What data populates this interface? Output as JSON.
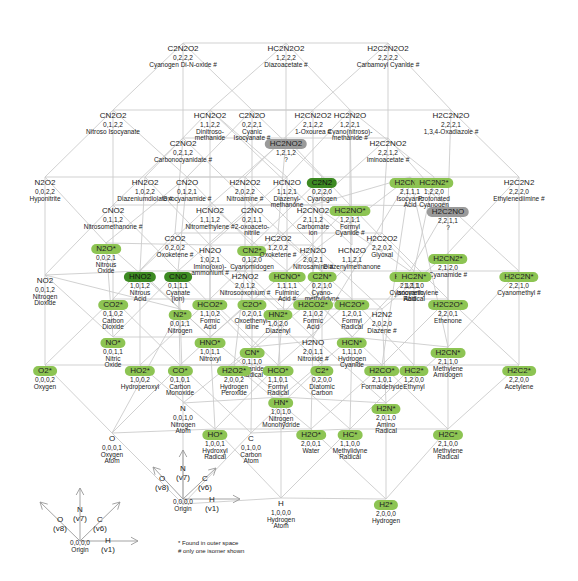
{
  "diagram": {
    "nodes": [
      {
        "id": "C2N2O2",
        "formula": "C2N2O2",
        "coords": "0,2,2,2",
        "name": "Cyanogen Di-N-oxide #",
        "x": 183,
        "y": 38,
        "hl": ""
      },
      {
        "id": "HC2N2O2",
        "formula": "HC2N2O2",
        "coords": "1,2,2,2",
        "name": "Diazoacetate #",
        "x": 286,
        "y": 38,
        "hl": ""
      },
      {
        "id": "H2C2N2O2",
        "formula": "H2C2N2O2",
        "coords": "2,2,2,2",
        "name": "Carbamoyl Cyanide #",
        "x": 388,
        "y": 38,
        "hl": ""
      },
      {
        "id": "CN2O2",
        "formula": "CN2O2",
        "coords": "0,1,2,2",
        "name": "Nitroso Isocyanate",
        "x": 113,
        "y": 105,
        "hl": ""
      },
      {
        "id": "HCN2O2",
        "formula": "HCN2O2",
        "coords": "1,1,2,2",
        "name": "Dinitroso-|methanide",
        "x": 210,
        "y": 105,
        "hl": ""
      },
      {
        "id": "C2N2O",
        "formula": "C2N2O",
        "coords": "0,2,2,1",
        "name": "Cyanic|Isocyanate #",
        "x": 252,
        "y": 105,
        "hl": ""
      },
      {
        "id": "H2CN2O2",
        "formula": "H2CN2O2",
        "coords": "2,1,2,2",
        "name": "1-Oxourea #",
        "x": 313,
        "y": 105,
        "hl": ""
      },
      {
        "id": "HC2N2O",
        "formula": "HC2N2O",
        "coords": "1,2,2,1",
        "name": "Cyano(nitroso)-|methanide #",
        "x": 350,
        "y": 105,
        "hl": ""
      },
      {
        "id": "H2C2N2O",
        "formula": "H2C2N2O",
        "coords": "2,2,2,1",
        "name": "1,3,4-Oxadiazole #",
        "x": 451,
        "y": 105,
        "hl": ""
      },
      {
        "id": "C2NO2",
        "formula": "C2NO2",
        "coords": "0,2,1,2",
        "name": "Carbonocyanidate #",
        "x": 183,
        "y": 133,
        "hl": ""
      },
      {
        "id": "HC2NO2",
        "formula": "HC2NO2",
        "coords": "1,2,1,2",
        "name": "?",
        "x": 286,
        "y": 133,
        "hl": "gray"
      },
      {
        "id": "H2C2NO2",
        "formula": "H2C2NO2",
        "coords": "2,2,1,2",
        "name": "Iminoacetate #",
        "x": 388,
        "y": 133,
        "hl": ""
      },
      {
        "id": "N2O2",
        "formula": "N2O2",
        "coords": "0,0,2,2",
        "name": "Hyponitrite",
        "x": 45,
        "y": 172,
        "hl": ""
      },
      {
        "id": "HN2O2",
        "formula": "HN2O2",
        "coords": "1,0,2,2",
        "name": "Diazeniumdiolate #",
        "x": 145,
        "y": 172,
        "hl": ""
      },
      {
        "id": "CN2O",
        "formula": "CN2O",
        "coords": "0,1,2,1",
        "name": "Oxocyanamide #",
        "x": 187,
        "y": 172,
        "hl": ""
      },
      {
        "id": "H2N2O2",
        "formula": "H2N2O2",
        "coords": "2,0,2,2",
        "name": "Nitroamine #",
        "x": 245,
        "y": 172,
        "hl": ""
      },
      {
        "id": "HCN2O",
        "formula": "HCN2O",
        "coords": "1,1,2,1",
        "name": "Diazenyl-|methanone",
        "x": 287,
        "y": 172,
        "hl": ""
      },
      {
        "id": "C2N2",
        "formula": "C2N2",
        "coords": "0,2,2,0",
        "name": "Cyanogen",
        "x": 322,
        "y": 172,
        "hl": "dark"
      },
      {
        "id": "H2CNO_top",
        "formula": "H2CNO*",
        "coords": "2,1,1,1",
        "name": "Isocyanic|Acid",
        "x": 410,
        "y": 172,
        "hl": "light"
      },
      {
        "id": "HC2N2",
        "formula": "HC2N2*",
        "coords": "1,2,2,0",
        "name": "Protonated|Cyanogen",
        "x": 434,
        "y": 172,
        "hl": "light"
      },
      {
        "id": "H2C2N2",
        "formula": "H2C2N2",
        "coords": "2,2,2,0",
        "name": "Ethylenediimine #",
        "x": 519,
        "y": 172,
        "hl": ""
      },
      {
        "id": "H2C2NO",
        "formula": "H2C2NO",
        "coords": "2,2,1,1",
        "name": "?",
        "x": 448,
        "y": 201,
        "hl": "gray"
      },
      {
        "id": "CNO2",
        "formula": "CNO2",
        "coords": "0,1,1,2",
        "name": "Nitrosomethanone #",
        "x": 113,
        "y": 200,
        "hl": ""
      },
      {
        "id": "HCNO2",
        "formula": "HCNO2",
        "coords": "1,1,1,2",
        "name": "Nitromethylene #",
        "x": 210,
        "y": 200,
        "hl": ""
      },
      {
        "id": "C2NO",
        "formula": "C2NO",
        "coords": "0,2,1,1",
        "name": "2-oxoaceto-|nitrile",
        "x": 252,
        "y": 200,
        "hl": ""
      },
      {
        "id": "H2CNO2",
        "formula": "H2CNO2",
        "coords": "2,1,1,2",
        "name": "Carbomate|ion",
        "x": 313,
        "y": 200,
        "hl": ""
      },
      {
        "id": "HC2NO",
        "formula": "HC2NO*",
        "coords": "1,2,1,1",
        "name": "Formyl|Cyanide #",
        "x": 350,
        "y": 200,
        "hl": "light"
      },
      {
        "id": "N2O",
        "formula": "N2O*",
        "coords": "0,0,2,1",
        "name": "Nitrous|Oxide",
        "x": 106,
        "y": 238,
        "hl": "light"
      },
      {
        "id": "C2O2",
        "formula": "C2O2",
        "coords": "0,2,0,2",
        "name": "Oxoketene #",
        "x": 175,
        "y": 228,
        "hl": ""
      },
      {
        "id": "HN2O",
        "formula": "HN2O",
        "coords": "1,0,2,1",
        "name": "Imino(oxo)-|ammonium #",
        "x": 210,
        "y": 240,
        "hl": ""
      },
      {
        "id": "CN2",
        "formula": "CN2*",
        "coords": "0,1,2,0",
        "name": "Cyanomidogen",
        "x": 252,
        "y": 240,
        "hl": "light"
      },
      {
        "id": "HC2O2",
        "formula": "HC2O2",
        "coords": "1,2,0,2",
        "name": "Oxoketene #",
        "x": 278,
        "y": 228,
        "hl": ""
      },
      {
        "id": "H2N2O",
        "formula": "H2N2O",
        "coords": "2,0,2,1",
        "name": "Nitrosamine #",
        "x": 313,
        "y": 240,
        "hl": ""
      },
      {
        "id": "HCN2O_b",
        "formula": "HCN2O",
        "coords": "1,1,2,1",
        "name": "Diazenylmethanone",
        "x": 352,
        "y": 240,
        "hl": ""
      },
      {
        "id": "H2C2O2",
        "formula": "H2C2O2",
        "coords": "2,2,0,2",
        "name": "Glyoxal",
        "x": 382,
        "y": 228,
        "hl": ""
      },
      {
        "id": "H2CN2",
        "formula": "H2CN2*",
        "coords": "2,1,2,0",
        "name": "Cyanamide #",
        "x": 448,
        "y": 248,
        "hl": "light"
      },
      {
        "id": "NO2",
        "formula": "NO2",
        "coords": "0,0,1,2",
        "name": "Nitrogen|Dioxide",
        "x": 45,
        "y": 270,
        "hl": ""
      },
      {
        "id": "HNO2",
        "formula": "HNO2",
        "coords": "1,0,1,2",
        "name": "Nitrous|Acid",
        "x": 140,
        "y": 266,
        "hl": "dark"
      },
      {
        "id": "CNO",
        "formula": "CNO",
        "coords": "0,1,1,1",
        "name": "Cyanate|(ion)",
        "x": 178,
        "y": 266,
        "hl": "dark"
      },
      {
        "id": "H2NO2",
        "formula": "H2NO2",
        "coords": "2,0,1,2",
        "name": "Nitrosooxonium #",
        "x": 245,
        "y": 266,
        "hl": ""
      },
      {
        "id": "HCNO",
        "formula": "HCNO*",
        "coords": "1,1,1,1",
        "name": "Fulminic|Acid #",
        "x": 287,
        "y": 266,
        "hl": "light"
      },
      {
        "id": "C2N",
        "formula": "C2N*",
        "coords": "0,2,1,0",
        "name": "Cyano-|methylidyne",
        "x": 322,
        "y": 266,
        "hl": "light"
      },
      {
        "id": "H2CNO",
        "formula": "H2CNO*",
        "coords": "2,1,1,1",
        "name": "Isocyanic|Acid",
        "x": 410,
        "y": 266,
        "hl": "light"
      },
      {
        "id": "HC2N",
        "formula": "HC2N*",
        "coords": "1,2,1,0",
        "name": "Cyanomethylene|Radical",
        "x": 414,
        "y": 266,
        "hl": "light"
      },
      {
        "id": "H2C2N",
        "formula": "H2C2N*",
        "coords": "2,2,1,0",
        "name": "Cyanomethyl #",
        "x": 519,
        "y": 266,
        "hl": "light"
      },
      {
        "id": "CO2",
        "formula": "CO2*",
        "coords": "0,1,0,2",
        "name": "Carbon|Dioxide",
        "x": 113,
        "y": 294,
        "hl": "light"
      },
      {
        "id": "N2",
        "formula": "N2*",
        "coords": "0,0,1,1",
        "name": "Nitrogen",
        "x": 180,
        "y": 304,
        "hl": "light"
      },
      {
        "id": "HCO2",
        "formula": "HCO2*",
        "coords": "1,1,0,2",
        "name": "Formic|Acid",
        "x": 210,
        "y": 294,
        "hl": "light"
      },
      {
        "id": "C2O",
        "formula": "C2O*",
        "coords": "0,2,0,1",
        "name": "Oxoethenyl-|idine",
        "x": 252,
        "y": 294,
        "hl": "light"
      },
      {
        "id": "HN2",
        "formula": "HN2*",
        "coords": "1,0,2,0",
        "name": "Diazenyl",
        "x": 278,
        "y": 304,
        "hl": "light"
      },
      {
        "id": "H2CO2",
        "formula": "H2CO2*",
        "coords": "2,1,0,2",
        "name": "Formic|Acid",
        "x": 313,
        "y": 294,
        "hl": "light"
      },
      {
        "id": "HC2O",
        "formula": "HC2O*",
        "coords": "1,2,0,1",
        "name": "Formyl|Radical",
        "x": 352,
        "y": 294,
        "hl": "light"
      },
      {
        "id": "H2N2",
        "formula": "H2N2",
        "coords": "2,0,2,0",
        "name": "Diazene #",
        "x": 382,
        "y": 304,
        "hl": ""
      },
      {
        "id": "H2C2O",
        "formula": "H2C2O*",
        "coords": "2,2,0,1",
        "name": "Ethenone",
        "x": 448,
        "y": 294,
        "hl": "light"
      },
      {
        "id": "NO",
        "formula": "NO*",
        "coords": "0,0,1,1",
        "name": "Nitric|Oxide",
        "x": 113,
        "y": 332,
        "hl": "light"
      },
      {
        "id": "HNO",
        "formula": "HNO*",
        "coords": "1,0,1,1",
        "name": "Nitroxyl",
        "x": 210,
        "y": 332,
        "hl": "light"
      },
      {
        "id": "CN",
        "formula": "CN*",
        "coords": "0,1,1,0",
        "name": "Cyanide|Radical",
        "x": 252,
        "y": 342,
        "hl": "light"
      },
      {
        "id": "H2NO",
        "formula": "H2NO",
        "coords": "2,0,1,1",
        "name": "Nitroxide #",
        "x": 313,
        "y": 332,
        "hl": ""
      },
      {
        "id": "HCN",
        "formula": "HCN*",
        "coords": "1,1,1,0",
        "name": "Hydrogen|Cyanide",
        "x": 352,
        "y": 332,
        "hl": "light"
      },
      {
        "id": "H2CN",
        "formula": "H2CN*",
        "coords": "2,1,1,0",
        "name": "Methylene|Amidogen",
        "x": 448,
        "y": 342,
        "hl": "light"
      },
      {
        "id": "O2",
        "formula": "O2*",
        "coords": "0,0,0,2",
        "name": "Oxygen",
        "x": 45,
        "y": 360,
        "hl": "light"
      },
      {
        "id": "HO2",
        "formula": "HO2*",
        "coords": "1,0,0,2",
        "name": "Hydroperoxyl",
        "x": 140,
        "y": 360,
        "hl": "light"
      },
      {
        "id": "CO",
        "formula": "CO*",
        "coords": "0,1,0,1",
        "name": "Carbon|Monoxide",
        "x": 180,
        "y": 360,
        "hl": "light"
      },
      {
        "id": "H2O2",
        "formula": "H2O2*",
        "coords": "2,0,0,2",
        "name": "Hydrogen|Peroxide",
        "x": 234,
        "y": 360,
        "hl": "light"
      },
      {
        "id": "HCO",
        "formula": "HCO*",
        "coords": "1,1,0,1",
        "name": "Formyl|Radical",
        "x": 278,
        "y": 360,
        "hl": "light"
      },
      {
        "id": "C2",
        "formula": "C2*",
        "coords": "0,2,0,0",
        "name": "Diatomic|Carbon",
        "x": 322,
        "y": 360,
        "hl": "light"
      },
      {
        "id": "H2CO",
        "formula": "H2CO*",
        "coords": "2,1,0,1",
        "name": "Formaldehyde",
        "x": 382,
        "y": 360,
        "hl": "light"
      },
      {
        "id": "HC2",
        "formula": "HC2*",
        "coords": "1,2,0,0",
        "name": "Ethynyl",
        "x": 414,
        "y": 360,
        "hl": "light"
      },
      {
        "id": "H2C2",
        "formula": "H2C2*",
        "coords": "2,2,0,0",
        "name": "Acetylene",
        "x": 519,
        "y": 360,
        "hl": "light"
      },
      {
        "id": "N",
        "formula": "N",
        "coords": "0,0,1,0",
        "name": "Nitrogen|Atom",
        "x": 183,
        "y": 398,
        "hl": ""
      },
      {
        "id": "HN",
        "formula": "HN*",
        "coords": "1,0,1,0",
        "name": "Nitrogen|Monohydride",
        "x": 281,
        "y": 392,
        "hl": "light"
      },
      {
        "id": "H2N",
        "formula": "H2N*",
        "coords": "2,0,1,0",
        "name": "Amino|Radical",
        "x": 386,
        "y": 398,
        "hl": "light"
      },
      {
        "id": "O",
        "formula": "O",
        "coords": "0,0,0,1",
        "name": "Oxygen|Atom",
        "x": 112,
        "y": 428,
        "hl": ""
      },
      {
        "id": "HO",
        "formula": "HO*",
        "coords": "1,0,0,1",
        "name": "Hydroxyl|Radical",
        "x": 215,
        "y": 424,
        "hl": "light"
      },
      {
        "id": "C",
        "formula": "C",
        "coords": "0,1,0,0",
        "name": "Carbon|Atom",
        "x": 251,
        "y": 428,
        "hl": ""
      },
      {
        "id": "H2O",
        "formula": "H2O*",
        "coords": "2,0,0,1",
        "name": "Water",
        "x": 311,
        "y": 424,
        "hl": "light"
      },
      {
        "id": "HC",
        "formula": "HC*",
        "coords": "1,1,0,0",
        "name": "Methylidyne|Radical",
        "x": 350,
        "y": 424,
        "hl": "light"
      },
      {
        "id": "H2C",
        "formula": "H2C*",
        "coords": "2,1,0,0",
        "name": "Methylene|Radical",
        "x": 448,
        "y": 424,
        "hl": "light"
      },
      {
        "id": "Origin",
        "formula": "",
        "coords": "0,0,0,0",
        "name": "Origin",
        "x": 183,
        "y": 499,
        "hl": ""
      },
      {
        "id": "H",
        "formula": "H",
        "coords": "1,0,0,0",
        "name": "Hydrogen|Atom",
        "x": 281,
        "y": 493,
        "hl": ""
      },
      {
        "id": "H2",
        "formula": "H2*",
        "coords": "2,0,0,0",
        "name": "Hydrogen",
        "x": 386,
        "y": 494,
        "hl": "light"
      }
    ],
    "axis_labels_main": [
      {
        "label": "O",
        "sub": "(v8)",
        "x": 162,
        "y": 475
      },
      {
        "label": "N",
        "sub": "(v7)",
        "x": 183,
        "y": 465
      },
      {
        "label": "C",
        "sub": "(v6)",
        "x": 205,
        "y": 475
      },
      {
        "label": "H",
        "sub": "(v1)",
        "x": 212,
        "y": 496
      }
    ],
    "axis_key": {
      "origin_coords": "0,0,0,0",
      "origin_label": "Origin",
      "axes": [
        {
          "label": "O",
          "sub": "(v8)",
          "x": 60,
          "y": 516
        },
        {
          "label": "N",
          "sub": "(v7)",
          "x": 80,
          "y": 506
        },
        {
          "label": "C",
          "sub": "(v6)",
          "x": 100,
          "y": 516
        },
        {
          "label": "H",
          "sub": "(v1)",
          "x": 108,
          "y": 537
        }
      ]
    },
    "legend": {
      "line1": "* Found in outer space",
      "line2": "# only one isomer shown"
    },
    "colors": {
      "highlight_light": "#8dc453",
      "highlight_dark": "#3d8a22",
      "highlight_gray": "#9a9a9a",
      "edge": "#cccccc"
    }
  }
}
